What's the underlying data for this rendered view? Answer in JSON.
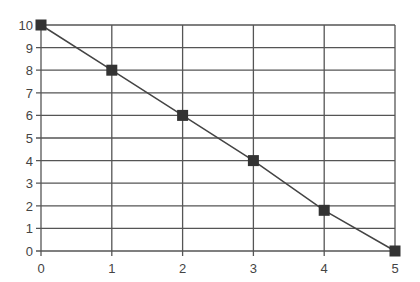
{
  "chart_data": {
    "type": "line",
    "title": "",
    "xlabel": "",
    "ylabel": "",
    "x": [
      0,
      1,
      2,
      3,
      4,
      5
    ],
    "series": [
      {
        "name": "",
        "values": [
          10,
          8,
          6,
          4,
          1.8,
          0
        ],
        "marker": "square"
      }
    ],
    "x_ticks": [
      "0",
      "1",
      "2",
      "3",
      "4",
      "5"
    ],
    "y_ticks": [
      "0",
      "1",
      "2",
      "3",
      "4",
      "5",
      "6",
      "7",
      "8",
      "9",
      "10"
    ],
    "xlim": [
      0,
      5
    ],
    "ylim": [
      0,
      10
    ],
    "grid": true,
    "legend": "none"
  },
  "colors": {
    "grid": "#555555",
    "line": "#444444",
    "marker": "#333333",
    "text": "#444444"
  }
}
